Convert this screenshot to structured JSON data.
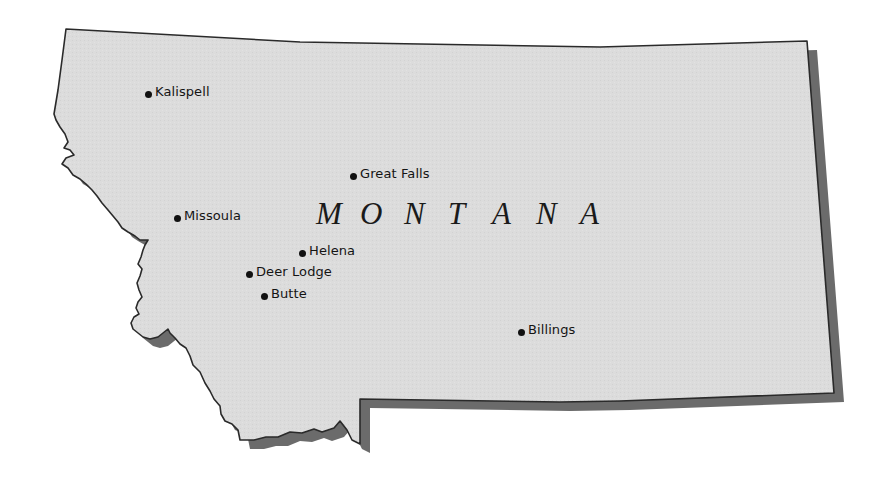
{
  "map": {
    "state_name": "MONTANA",
    "state_letters": [
      "M",
      "O",
      "N",
      "T",
      "A",
      "N",
      "A"
    ],
    "colors": {
      "land_fill": "#dcdcdc",
      "outline": "#2a2a2a",
      "shadow": "#6b6b6b",
      "background": "#ffffff",
      "city_dot": "#111111",
      "label_text": "#141414"
    },
    "cities": [
      {
        "name": "Kalispell",
        "x": 149,
        "y": 95
      },
      {
        "name": "Great Falls",
        "x": 354,
        "y": 177
      },
      {
        "name": "Missoula",
        "x": 178,
        "y": 221
      },
      {
        "name": "Helena",
        "x": 303,
        "y": 256
      },
      {
        "name": "Deer Lodge",
        "x": 250,
        "y": 276
      },
      {
        "name": "Butte",
        "x": 265,
        "y": 299
      },
      {
        "name": "Billings",
        "x": 522,
        "y": 335
      }
    ]
  }
}
